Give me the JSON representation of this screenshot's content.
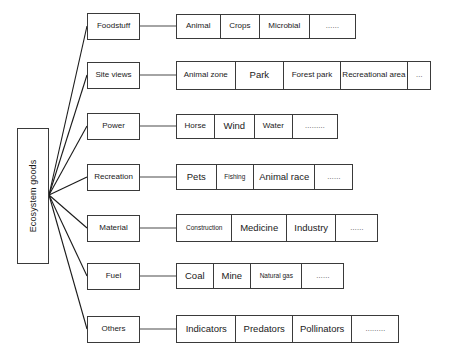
{
  "diagram": {
    "root": {
      "label": "Ecosystem goods",
      "orientation": "vertical"
    },
    "rows": [
      {
        "category": "Foodstuff",
        "children": [
          {
            "label": "Animal",
            "size": "m"
          },
          {
            "label": "Crops",
            "size": "m"
          },
          {
            "label": "Microbial",
            "size": "m"
          },
          {
            "label": "……",
            "size": "e"
          }
        ]
      },
      {
        "category": "Site views",
        "children": [
          {
            "label": "Animal zone",
            "size": "m"
          },
          {
            "label": "Park",
            "size": "l"
          },
          {
            "label": "Forest park",
            "size": "m"
          },
          {
            "label": "Recreational area",
            "size": "m"
          },
          {
            "label": "…",
            "size": "e"
          }
        ]
      },
      {
        "category": "Power",
        "children": [
          {
            "label": "Horse",
            "size": "m"
          },
          {
            "label": "Wind",
            "size": "l"
          },
          {
            "label": "Water",
            "size": "m"
          },
          {
            "label": "………",
            "size": "e"
          }
        ]
      },
      {
        "category": "Recreation",
        "children": [
          {
            "label": "Pets",
            "size": "l"
          },
          {
            "label": "Fishing",
            "size": "s"
          },
          {
            "label": "Animal race",
            "size": "l"
          },
          {
            "label": "……",
            "size": "e"
          }
        ]
      },
      {
        "category": "Material",
        "children": [
          {
            "label": "Construction",
            "size": "s"
          },
          {
            "label": "Medicine",
            "size": "l"
          },
          {
            "label": "Industry",
            "size": "l"
          },
          {
            "label": "……",
            "size": "e"
          }
        ]
      },
      {
        "category": "Fuel",
        "children": [
          {
            "label": "Coal",
            "size": "l"
          },
          {
            "label": "Mine",
            "size": "l"
          },
          {
            "label": "Natural gas",
            "size": "s"
          },
          {
            "label": "……",
            "size": "e"
          }
        ]
      },
      {
        "category": "Others",
        "children": [
          {
            "label": "Indicators",
            "size": "l"
          },
          {
            "label": "Predators",
            "size": "l"
          },
          {
            "label": "Pollinators",
            "size": "l"
          },
          {
            "label": "………",
            "size": "e"
          }
        ]
      }
    ]
  },
  "style": {
    "stroke": "#3a3a3a",
    "background": "#ffffff",
    "text": "#1a1a1a"
  }
}
